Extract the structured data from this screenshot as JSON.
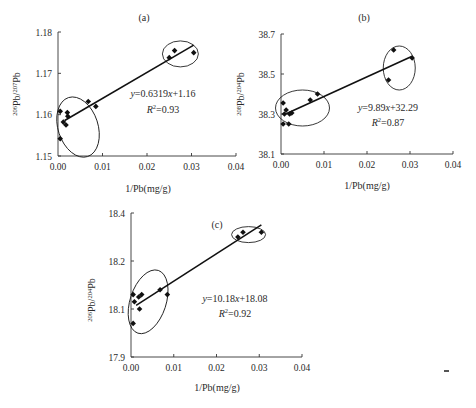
{
  "chart_data": [
    {
      "id": "a",
      "type": "scatter",
      "panel_label": "(a)",
      "xlabel": "1/Pb(mg/g)",
      "ylabel_parts": {
        "sup1": "206",
        "base1": "Pb/",
        "sup2": "207",
        "base2": "Pb"
      },
      "xlim": [
        0,
        0.04
      ],
      "ylim": [
        1.15,
        1.18
      ],
      "x_ticks": [
        "0.00",
        "0.01",
        "0.02",
        "0.03",
        "0.04"
      ],
      "y_ticks": [
        "1.15",
        "1.16",
        "1.17",
        "1.18"
      ],
      "grid": false,
      "equation": {
        "pre": "y",
        "mid": "=0.6319",
        "var": "x",
        "post": "+1.16"
      },
      "r2": {
        "label": "R",
        "sup": "2",
        "value": "=0.93"
      },
      "fit": {
        "slope": 0.6319,
        "intercept": 1.16,
        "x_range": [
          0.0015,
          0.0305
        ]
      },
      "points": [
        {
          "x": 0.0005,
          "y": 1.1608
        },
        {
          "x": 0.0005,
          "y": 1.1542
        },
        {
          "x": 0.0012,
          "y": 1.1582
        },
        {
          "x": 0.0018,
          "y": 1.1575
        },
        {
          "x": 0.0021,
          "y": 1.1605
        },
        {
          "x": 0.0022,
          "y": 1.1596
        },
        {
          "x": 0.0068,
          "y": 1.1632
        },
        {
          "x": 0.0085,
          "y": 1.162
        },
        {
          "x": 0.025,
          "y": 1.1738
        },
        {
          "x": 0.0262,
          "y": 1.1755
        },
        {
          "x": 0.0305,
          "y": 1.175
        }
      ],
      "ellipses": [
        {
          "cx": 0.0045,
          "cy": 1.157,
          "rx_px": 20,
          "ry_px": 31,
          "rot": -18
        },
        {
          "cx": 0.0275,
          "cy": 1.1747,
          "rx_px": 18,
          "ry_px": 13,
          "rot": 0
        }
      ]
    },
    {
      "id": "b",
      "type": "scatter",
      "panel_label": "(b)",
      "xlabel": "1/Pb(mg/g)",
      "ylabel_parts": {
        "sup1": "208",
        "base1": "Pb/",
        "sup2": "204",
        "base2": "Pb"
      },
      "xlim": [
        0,
        0.04
      ],
      "ylim": [
        38.1,
        38.7
      ],
      "x_ticks": [
        "0.00",
        "0.01",
        "0.02",
        "0.03",
        "0.04"
      ],
      "y_ticks": [
        "38.1",
        "38.3",
        "38.5",
        "38.7"
      ],
      "grid": false,
      "equation": {
        "pre": "y",
        "mid": "=9.89",
        "var": "x",
        "post": "+32.29"
      },
      "r2": {
        "label": "R",
        "sup": "2",
        "value": "=0.87"
      },
      "fit": {
        "slope": 9.89,
        "intercept": 38.29,
        "x_range": [
          0.0012,
          0.0305
        ]
      },
      "points": [
        {
          "x": 0.0005,
          "y": 38.355
        },
        {
          "x": 0.0008,
          "y": 38.3
        },
        {
          "x": 0.0012,
          "y": 38.32
        },
        {
          "x": 0.0005,
          "y": 38.25
        },
        {
          "x": 0.0018,
          "y": 38.25
        },
        {
          "x": 0.002,
          "y": 38.3
        },
        {
          "x": 0.0025,
          "y": 38.305
        },
        {
          "x": 0.0068,
          "y": 38.37
        },
        {
          "x": 0.0085,
          "y": 38.4
        },
        {
          "x": 0.025,
          "y": 38.47
        },
        {
          "x": 0.0262,
          "y": 38.62
        },
        {
          "x": 0.0305,
          "y": 38.58
        }
      ],
      "ellipses": [
        {
          "cx": 0.005,
          "cy": 38.33,
          "rx_px": 27,
          "ry_px": 18,
          "rot": 0
        },
        {
          "cx": 0.0275,
          "cy": 38.53,
          "rx_px": 16,
          "ry_px": 22,
          "rot": 0
        }
      ]
    },
    {
      "id": "c",
      "type": "scatter",
      "panel_label": "(c)",
      "xlabel": "1/Pb(mg/g)",
      "ylabel_parts": {
        "sup1": "206",
        "base1": "Pb/",
        "sup2": "204",
        "base2": "Pb"
      },
      "xlim": [
        0,
        0.04
      ],
      "ylim": [
        17.9,
        18.5
      ],
      "x_ticks": [
        "0.00",
        "0.01",
        "0.02",
        "0.03",
        "0.04"
      ],
      "y_ticks": [
        "17.9",
        "18.1",
        "18.2",
        "18.4"
      ],
      "grid": false,
      "equation": {
        "pre": "y",
        "mid": "=10.18",
        "var": "x",
        "post": "+18.08"
      },
      "r2": {
        "label": "R",
        "sup": "2",
        "value": "=0.92"
      },
      "fit": {
        "slope": 10.18,
        "intercept": 18.08,
        "x_range": [
          0.0012,
          0.0305
        ]
      },
      "points": [
        {
          "x": 0.0005,
          "y": 18.16
        },
        {
          "x": 0.0008,
          "y": 18.13
        },
        {
          "x": 0.0005,
          "y": 18.04
        },
        {
          "x": 0.0018,
          "y": 18.15
        },
        {
          "x": 0.002,
          "y": 18.1
        },
        {
          "x": 0.0025,
          "y": 18.16
        },
        {
          "x": 0.0068,
          "y": 18.18
        },
        {
          "x": 0.0085,
          "y": 18.16
        },
        {
          "x": 0.025,
          "y": 18.4
        },
        {
          "x": 0.0262,
          "y": 18.42
        },
        {
          "x": 0.0305,
          "y": 18.42
        }
      ],
      "ellipses": [
        {
          "cx": 0.004,
          "cy": 18.13,
          "rx_px": 18,
          "ry_px": 33,
          "rot": 18
        },
        {
          "cx": 0.0275,
          "cy": 18.41,
          "rx_px": 17,
          "ry_px": 8,
          "rot": 0
        }
      ]
    }
  ]
}
